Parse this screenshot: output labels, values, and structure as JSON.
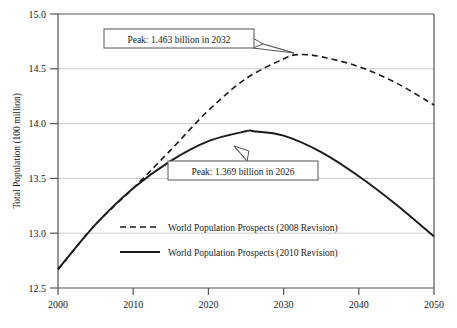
{
  "chart_data": {
    "type": "line",
    "title": "",
    "xlabel": "",
    "ylabel": "Total Population (100 million)",
    "xlim": [
      2000,
      2050
    ],
    "ylim": [
      12.5,
      15.0
    ],
    "grid": true,
    "legend_position": "bottom-center",
    "xticks": [
      "2000",
      "2010",
      "2020",
      "2030",
      "2040",
      "2050"
    ],
    "yticks": [
      "12.5",
      "13.0",
      "13.5",
      "14.0",
      "14.5",
      "15.0"
    ],
    "series": [
      {
        "name": "World Population Prospects (2008 Revision)",
        "style": "dashed",
        "color": "#1a1a1a",
        "x": [
          2000,
          2005,
          2010,
          2015,
          2020,
          2025,
          2030,
          2032,
          2035,
          2040,
          2045,
          2050
        ],
        "values": [
          12.67,
          13.08,
          13.41,
          13.76,
          14.12,
          14.41,
          14.59,
          14.63,
          14.61,
          14.52,
          14.37,
          14.17
        ]
      },
      {
        "name": "World Population Prospects (2010 Revision)",
        "style": "solid",
        "color": "#1a1a1a",
        "x": [
          2000,
          2005,
          2010,
          2015,
          2020,
          2025,
          2026,
          2030,
          2035,
          2040,
          2045,
          2050
        ],
        "values": [
          12.67,
          13.08,
          13.41,
          13.66,
          13.84,
          13.93,
          13.93,
          13.89,
          13.74,
          13.52,
          13.26,
          12.97
        ]
      }
    ],
    "annotations": [
      {
        "id": "peak-2008",
        "text": "Peak: 1.463 billion in 2032",
        "point_x": 2032,
        "point_y": 14.63
      },
      {
        "id": "peak-2010",
        "text": "Peak: 1.369 billion in 2026",
        "point_x": 2026,
        "point_y": 13.93
      }
    ]
  }
}
